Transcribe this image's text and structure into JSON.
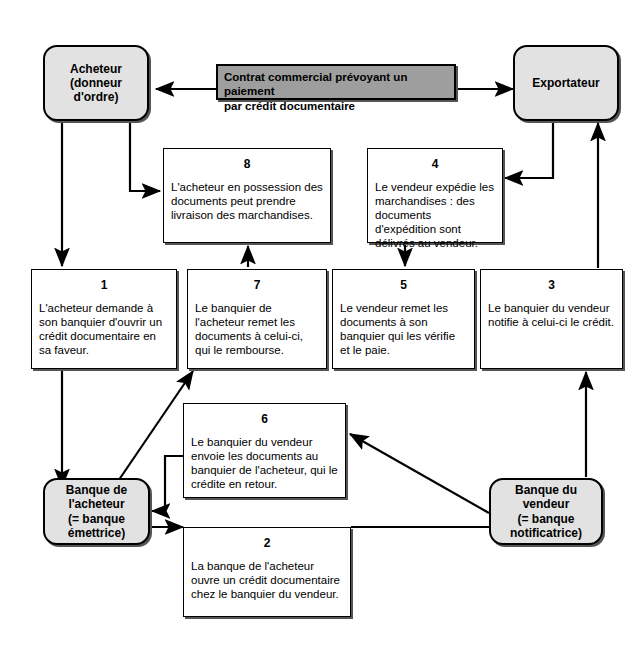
{
  "diagram": {
    "colors": {
      "actor_fill": "#e2e2e2",
      "contract_fill": "#9e9e9e",
      "step_fill": "#ffffff",
      "stroke": "#000000",
      "shadow": "#555555"
    }
  },
  "actors": {
    "buyer": {
      "line1": "Acheteur",
      "line2": "(donneur",
      "line3": "d'ordre)"
    },
    "exporter": {
      "line1": "Exportateur"
    },
    "buyer_bank": {
      "line1": "Banque de",
      "line2": "l'acheteur",
      "line3": "(= banque",
      "line4": "émettrice)"
    },
    "seller_bank": {
      "line1": "Banque du",
      "line2": "vendeur",
      "line3": "(= banque",
      "line4": "notificatrice)"
    }
  },
  "contract": {
    "line1": "Contrat commercial prévoyant un paiement",
    "line2": "par crédit documentaire"
  },
  "steps": [
    {
      "num": "1",
      "text": "L'acheteur demande à son banquier d'ouvrir un crédit documentaire en sa faveur."
    },
    {
      "num": "2",
      "text": "La banque de l'acheteur ouvre un crédit documentaire chez le banquier du vendeur."
    },
    {
      "num": "3",
      "text": "Le banquier du vendeur notifie à celui-ci le crédit."
    },
    {
      "num": "4",
      "text": "Le vendeur expédie les marchandises : des documents d'expédition sont délivrés au vendeur."
    },
    {
      "num": "5",
      "text": "Le vendeur remet les documents à son banquier qui les vérifie et le paie."
    },
    {
      "num": "6",
      "text": "Le banquier du vendeur envoie les documents au banquier de l'acheteur, qui le crédite en retour."
    },
    {
      "num": "7",
      "text": "Le banquier de l'acheteur remet les documents à celui-ci, qui le rembourse."
    },
    {
      "num": "8",
      "text": "L'acheteur en possession des documents peut prendre livraison des marchandises."
    }
  ]
}
